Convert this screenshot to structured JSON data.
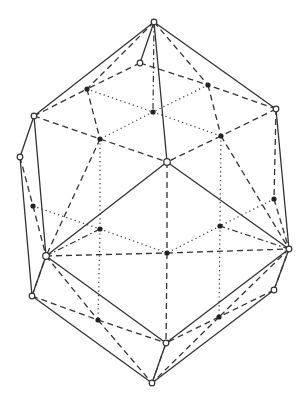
{
  "diagram": {
    "title": "",
    "type": "polyhedron-wireframe",
    "colors": {
      "background": "#ffffff",
      "stroke": "#333333",
      "filled_vertex": "#222222"
    },
    "open_vertices": {
      "top": [
        154,
        22
      ],
      "top_inner": [
        140,
        63
      ],
      "ul": [
        34,
        116
      ],
      "ur": [
        276,
        109
      ],
      "far_left": [
        20,
        157
      ],
      "center": [
        167,
        162
      ],
      "left": [
        46,
        256
      ],
      "right": [
        289,
        249
      ],
      "ll": [
        32,
        296
      ],
      "lr": [
        274,
        290
      ],
      "low_mid": [
        166,
        343
      ],
      "bottom": [
        152,
        383
      ]
    },
    "filled_vertices": {
      "f1": [
        87,
        89
      ],
      "f2": [
        208,
        85
      ],
      "f3": [
        153,
        112
      ],
      "f4": [
        100,
        139
      ],
      "f5": [
        221,
        136
      ],
      "f6": [
        33,
        206
      ],
      "f7": [
        274,
        199
      ],
      "f8": [
        100,
        229
      ],
      "f9": [
        220,
        226
      ],
      "f10": [
        167,
        253
      ],
      "f11": [
        98,
        320
      ],
      "f12": [
        219,
        317
      ]
    },
    "edges": [
      [
        "top",
        "ul",
        "solid"
      ],
      [
        "top",
        "ur",
        "solid"
      ],
      [
        "top",
        "center",
        "solid"
      ],
      [
        "top",
        "top_inner",
        "solid"
      ],
      [
        "center",
        "left",
        "solid"
      ],
      [
        "center",
        "right",
        "solid"
      ],
      [
        "ul",
        "far_left",
        "solid"
      ],
      [
        "ul",
        "left",
        "solid"
      ],
      [
        "far_left",
        "ll",
        "solid"
      ],
      [
        "left",
        "ll",
        "solid"
      ],
      [
        "ur",
        "right",
        "solid"
      ],
      [
        "right",
        "lr",
        "solid"
      ],
      [
        "left",
        "low_mid",
        "solid"
      ],
      [
        "ll",
        "bottom",
        "solid"
      ],
      [
        "right",
        "low_mid",
        "solid"
      ],
      [
        "lr",
        "bottom",
        "solid"
      ],
      [
        "low_mid",
        "bottom",
        "solid"
      ],
      [
        "top",
        "f1",
        "dashed"
      ],
      [
        "top",
        "f2",
        "dashed"
      ],
      [
        "top_inner",
        "f1",
        "dashed"
      ],
      [
        "top_inner",
        "f2",
        "dashed"
      ],
      [
        "ul",
        "f4",
        "dashed"
      ],
      [
        "ur",
        "f5",
        "dashed"
      ],
      [
        "f4",
        "center",
        "dashed"
      ],
      [
        "f5",
        "center",
        "dashed"
      ],
      [
        "ul",
        "f1",
        "dashed"
      ],
      [
        "ur",
        "f2",
        "dashed"
      ],
      [
        "f1",
        "f4",
        "dashed"
      ],
      [
        "f2",
        "f5",
        "dashed"
      ],
      [
        "far_left",
        "f6",
        "dashed"
      ],
      [
        "f6",
        "left",
        "dashed"
      ],
      [
        "ur",
        "f7",
        "dashed"
      ],
      [
        "f7",
        "right",
        "dashed"
      ],
      [
        "f4",
        "left",
        "dashed"
      ],
      [
        "f5",
        "right",
        "dashed"
      ],
      [
        "left",
        "f10",
        "dashed"
      ],
      [
        "f10",
        "right",
        "dashed"
      ],
      [
        "center",
        "f10",
        "dashed"
      ],
      [
        "ll",
        "f11",
        "dashed"
      ],
      [
        "f11",
        "low_mid",
        "dashed"
      ],
      [
        "left",
        "f11",
        "dashed"
      ],
      [
        "f11",
        "bottom",
        "dashed"
      ],
      [
        "lr",
        "f12",
        "dashed"
      ],
      [
        "f12",
        "low_mid",
        "dashed"
      ],
      [
        "right",
        "f12",
        "dashed"
      ],
      [
        "f12",
        "bottom",
        "dashed"
      ],
      [
        "f10",
        "low_mid",
        "dashed"
      ],
      [
        "ll",
        "left",
        "dashed"
      ],
      [
        "lr",
        "right",
        "dashed"
      ],
      [
        "f1",
        "f3",
        "dotted"
      ],
      [
        "f2",
        "f3",
        "dotted"
      ],
      [
        "f3",
        "f4",
        "dotted"
      ],
      [
        "f3",
        "f5",
        "dotted"
      ],
      [
        "f4",
        "f8",
        "dotted"
      ],
      [
        "f5",
        "f9",
        "dotted"
      ],
      [
        "f6",
        "f8",
        "dotted"
      ],
      [
        "f7",
        "f9",
        "dotted"
      ],
      [
        "f8",
        "f10",
        "dotted"
      ],
      [
        "f9",
        "f10",
        "dotted"
      ],
      [
        "f8",
        "f11",
        "dotted"
      ],
      [
        "f9",
        "f12",
        "dotted"
      ],
      [
        "top",
        "f3",
        "dashdot"
      ],
      [
        "left",
        "f8",
        "dashdot"
      ],
      [
        "right",
        "f9",
        "dashdot"
      ],
      [
        "low_mid",
        "bottom",
        "dashdot"
      ]
    ]
  }
}
